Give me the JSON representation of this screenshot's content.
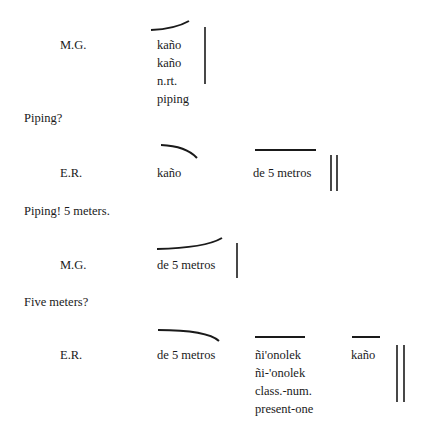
{
  "transcript": {
    "turns": [
      {
        "speaker": "M.G.",
        "words": [
          {
            "lines": [
              "kaño",
              "kaño",
              "n.rt.",
              "piping"
            ],
            "contour": "rising-curve"
          }
        ],
        "boundary": "single-bar",
        "translation": "Piping?"
      },
      {
        "speaker": "E.R.",
        "words": [
          {
            "lines": [
              "kaño"
            ],
            "contour": "falling-arc"
          },
          {
            "lines": [
              "de 5 metros"
            ],
            "contour": "level"
          }
        ],
        "boundary": "double-bar",
        "translation": "Piping! 5 meters."
      },
      {
        "speaker": "M.G.",
        "words": [
          {
            "lines": [
              "de 5 metros"
            ],
            "contour": "rising-curve"
          }
        ],
        "boundary": "single-bar",
        "translation": "Five meters?"
      },
      {
        "speaker": "E.R.",
        "words": [
          {
            "lines": [
              "de 5 metros"
            ],
            "contour": "falling-arc"
          },
          {
            "lines": [
              "ñi'onolek",
              "ñi-'onolek",
              "class.-num.",
              "present-one"
            ],
            "contour": "level"
          },
          {
            "lines": [
              "kaño"
            ],
            "contour": "level"
          }
        ],
        "boundary": "double-bar",
        "translation": ""
      }
    ]
  }
}
